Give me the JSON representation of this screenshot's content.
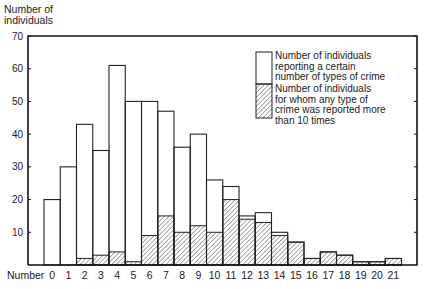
{
  "chart_data": {
    "type": "bar",
    "title": "",
    "xlabel": "Number",
    "ylabel": "Number of individuals",
    "ylim": [
      0,
      70
    ],
    "yticks": [
      10,
      20,
      30,
      40,
      50,
      60,
      70
    ],
    "grid": false,
    "legend_position": "upper right",
    "categories": [
      "0",
      "1",
      "2",
      "3",
      "4",
      "5",
      "6",
      "7",
      "8",
      "9",
      "10",
      "11",
      "12",
      "13",
      "14",
      "15",
      "16",
      "17",
      "18",
      "19",
      "20",
      "21"
    ],
    "series": [
      {
        "name": "Number of individuals reporting a certain number of types of crime",
        "style": "open",
        "values": [
          20,
          30,
          43,
          35,
          61,
          50,
          50,
          47,
          36,
          40,
          26,
          24,
          15,
          16,
          10,
          7,
          2,
          4,
          3,
          1,
          1,
          2
        ]
      },
      {
        "name": "Number of individuals for whom any type of crime was reported more than 10 times",
        "style": "hatched",
        "values": [
          0,
          0,
          2,
          3,
          4,
          1,
          9,
          15,
          10,
          12,
          10,
          20,
          14,
          13,
          9,
          7,
          2,
          4,
          3,
          1,
          1,
          2
        ]
      }
    ]
  },
  "axis": {
    "ylabel_line1": "Number of",
    "ylabel_line2": "individuals",
    "xlabel": "Number"
  },
  "legend": {
    "item1": [
      "Number of individuals",
      "reporting a certain",
      "number of types of crime"
    ],
    "item2": [
      "Number of individuals",
      "for whom any type of",
      "crime was reported more",
      "than 10 times"
    ]
  }
}
